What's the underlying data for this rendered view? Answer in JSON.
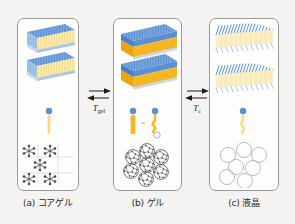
{
  "figure": {
    "background_color": "#f4f3f1",
    "panel_background": "#fdfdfc",
    "panel_border_color": "#9a9a97"
  },
  "colors": {
    "headgroup_blue": "#5b8fd4",
    "headgroup_blue_light": "#7facdf",
    "tail_yellow": "#f7d98a",
    "tail_yellow_pale": "#fbeec2",
    "tail_amber": "#f5b824",
    "tail_amber_dark": "#e8a511",
    "outline_gray": "#8c8c8a",
    "text_color": "#2b2b2b"
  },
  "panels": [
    {
      "id": "a",
      "caption": "(a) コアゲル",
      "phase_name_romaji": "coagel",
      "lamellae_count": 2,
      "lamellae_style": "striated-thin-bilayer",
      "packing_label": "crystalline-lattice",
      "packing_shapes": 5,
      "packing_shape_type": "star-cross",
      "molecule_count": 1,
      "molecule_state": "extended-ordered-chain"
    },
    {
      "id": "b",
      "caption": "(b) ゲル",
      "phase_name_romaji": "gel",
      "lamellae_count": 2,
      "lamellae_style": "solid-thick-slab",
      "packing_label": "hydrated-circles-with-network",
      "packing_shapes": 7,
      "packing_shape_type": "circle-with-mesh",
      "molecule_count": 2,
      "molecule_state": "extended-chain-with-water"
    },
    {
      "id": "c",
      "caption": "(c) 液晶",
      "phase_name_romaji": "liquid crystal",
      "lamellae_count": 2,
      "lamellae_style": "tilted-disordered-bilayer",
      "packing_label": "disordered-empty-circles",
      "packing_shapes": 7,
      "packing_shape_type": "circle-plain",
      "molecule_count": 1,
      "molecule_state": "melted-disordered-chain"
    }
  ],
  "transitions": [
    {
      "id": "t-gel",
      "symbol": "T",
      "subscript": "gel",
      "arrow_type": "equilibrium-double-arrow",
      "between": [
        "a",
        "b"
      ]
    },
    {
      "id": "t-c",
      "symbol": "T",
      "subscript": "c",
      "arrow_type": "equilibrium-double-arrow",
      "between": [
        "b",
        "c"
      ]
    }
  ]
}
